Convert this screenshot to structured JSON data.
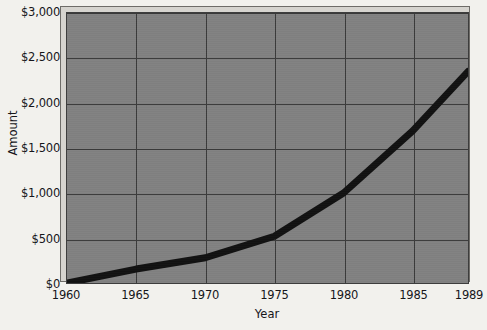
{
  "chart_data": {
    "type": "line",
    "title": "",
    "subtitle": "",
    "xlabel": "Year",
    "ylabel": "Amount",
    "x": [
      1960,
      1965,
      1970,
      1975,
      1980,
      1985,
      1989
    ],
    "values": [
      0,
      155,
      280,
      520,
      1000,
      1690,
      2350
    ],
    "series": [
      {
        "name": "Amount",
        "values": [
          0,
          155,
          280,
          520,
          1000,
          1690,
          2350
        ],
        "color": "#111111",
        "line_width": 7
      }
    ],
    "xlim": [
      1960,
      1989
    ],
    "ylim": [
      0,
      3000
    ],
    "y_ticks": [
      0,
      500,
      1000,
      1500,
      2000,
      2500,
      3000
    ],
    "y_tick_labels": [
      "$0",
      "$500",
      "$1,000",
      "$1,500",
      "$2,000",
      "$2,500",
      "$3,000"
    ],
    "x_ticks": [
      1960,
      1965,
      1970,
      1975,
      1980,
      1985,
      1989
    ],
    "x_tick_labels": [
      "1960",
      "1965",
      "1970",
      "1975",
      "1980",
      "1985",
      "1989"
    ],
    "grid": true,
    "legend": false,
    "legend_position": "none",
    "style": "3d-block",
    "colors": {
      "figure_background": "#f2f1ed",
      "plot_background": "#818181",
      "plot_border": "#3d3d3d",
      "bevel": "#d6d4cf",
      "bevel_border": "#6e6c68",
      "gridline": "#3a3a3a",
      "line": "#111111",
      "text": "#16161a"
    }
  }
}
